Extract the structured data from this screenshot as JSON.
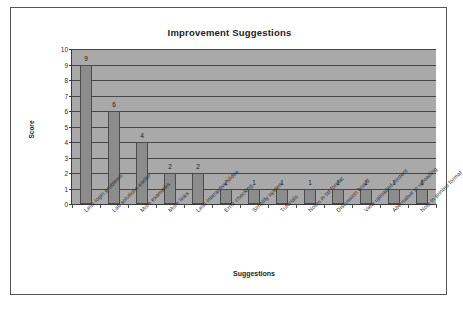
{
  "chart_data": {
    "type": "bar",
    "title": "Improvement Suggestions",
    "xlabel": "Suggestions",
    "ylabel": "Score",
    "ylim": [
      0,
      10
    ],
    "yticks": [
      0,
      1,
      2,
      3,
      4,
      5,
      6,
      7,
      8,
      9,
      10
    ],
    "grid": true,
    "legend": "none",
    "categories": [
      "Less login problems",
      "Lab solutions earlier",
      "More examples",
      "More links",
      "Less interactive slides",
      "Error checking",
      "Simplify system",
      "Tutorials",
      "Notes in txt format",
      "Discussion board",
      "View uploaded content",
      "Alternative to uploading",
      "Note in printed format"
    ],
    "values": [
      9,
      6,
      4,
      2,
      2,
      1,
      1,
      1,
      1,
      1,
      1,
      1,
      1
    ],
    "value_labels": [
      "9",
      "6",
      "4",
      "2",
      "2",
      "1",
      "1",
      "1",
      "1",
      "1",
      "1",
      "1",
      "1"
    ],
    "colors": {
      "bar_fill": "#8c8c8c",
      "bar_border": "#4a4a4a",
      "plot_background": "#a9a9a9",
      "gridline": "#474747",
      "axis": "#3a3a3a",
      "frame_background": "#ffffff",
      "frame_border": "#555555",
      "text": "#1d1d1d"
    }
  }
}
